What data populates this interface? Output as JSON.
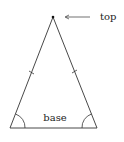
{
  "diagram": {
    "type": "isosceles-triangle",
    "labels": {
      "top": "top",
      "base": "base"
    },
    "colors": {
      "stroke": "#333333",
      "background": "#ffffff"
    }
  }
}
